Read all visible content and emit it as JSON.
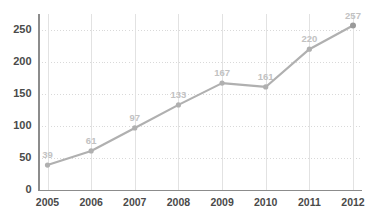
{
  "chart_data": {
    "type": "line",
    "title": "",
    "subtitle": "",
    "xlabel": "",
    "ylabel": "",
    "categories": [
      "2005",
      "2006",
      "2007",
      "2008",
      "2009",
      "2010",
      "2011",
      "2012"
    ],
    "values": [
      39,
      61,
      97,
      133,
      167,
      161,
      220,
      257
    ],
    "point_labels": [
      "39",
      "61",
      "97",
      "133",
      "167",
      "161",
      "220",
      "257"
    ],
    "ylim": [
      0,
      275
    ],
    "yticks": [
      0,
      50,
      100,
      150,
      200,
      250
    ],
    "ytick_labels": [
      "0",
      "50",
      "100",
      "150",
      "200",
      "250"
    ],
    "xticks": [
      "2005",
      "2006",
      "2007",
      "2008",
      "2009",
      "2010",
      "2011",
      "2012"
    ],
    "grid": {
      "horizontal": true,
      "horizontal_style": "dotted",
      "vertical": true,
      "vertical_style": "solid"
    },
    "legend": {
      "visible": false,
      "entries": []
    },
    "series": [
      {
        "name": "series-1",
        "values": [
          39,
          61,
          97,
          133,
          167,
          161,
          220,
          257
        ]
      }
    ],
    "colors": {
      "line": "#b0b0b0",
      "marker": "#b0b0b0",
      "marker_last": "#9a9a9a",
      "point_label": "#c2c2c2",
      "tick_label": "#4a4a4a",
      "grid_horizontal": "#d9d9d9",
      "grid_vertical": "#e2e2e2",
      "axis": "#8c8c8c",
      "background": "#ffffff"
    }
  }
}
